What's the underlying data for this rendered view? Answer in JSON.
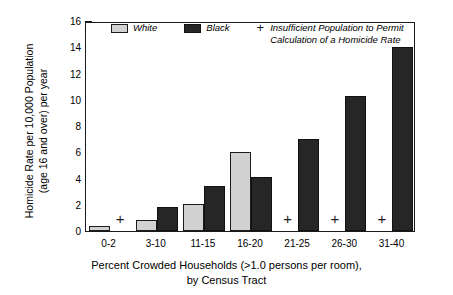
{
  "chart_data": {
    "type": "bar",
    "title": "",
    "categories": [
      "0-2",
      "3-10",
      "11-15",
      "16-20",
      "21-25",
      "26-30",
      "31-40"
    ],
    "series": [
      {
        "name": "White",
        "color": "#d2d2d2",
        "values": [
          0.35,
          0.85,
          2.05,
          6.0,
          null,
          null,
          null
        ],
        "missing_marker": "+"
      },
      {
        "name": "Black",
        "color": "#262626",
        "values": [
          null,
          1.8,
          3.4,
          4.15,
          7.0,
          10.25,
          14.0
        ],
        "missing_marker": "+"
      }
    ],
    "xlabel": "Percent Crowded Households (>1.0 persons per room),\nby Census Tract",
    "ylabel": "Homicide Rate per 10,000 Population\n(age 16 and over) per year",
    "ylim": [
      0,
      16
    ],
    "yticks": [
      0,
      2,
      4,
      6,
      8,
      10,
      12,
      14,
      16
    ],
    "ytick_labels": [
      "0",
      "2",
      "4",
      "6",
      "8",
      "10",
      "12",
      "14",
      "16"
    ],
    "grid": false,
    "legend_position": "top-left-inside",
    "annotations": [
      {
        "marker": "+",
        "text": "Insufficient Population to Permit\nCalculation of a Homicide Rate"
      }
    ]
  },
  "legend": {
    "white_label": "White",
    "black_label": "Black",
    "plus_symbol": "+",
    "note": "Insufficient Population to Permit\nCalculation of a Homicide Rate"
  },
  "axes": {
    "y_title": "Homicide Rate per 10,000 Population\n(age 16 and over) per year",
    "x_title": "Percent Crowded Households (>1.0 persons per room),\nby Census Tract"
  }
}
